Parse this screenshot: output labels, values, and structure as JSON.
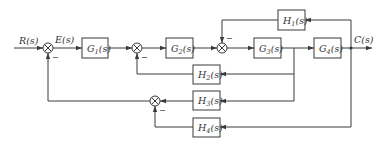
{
  "diagram": {
    "type": "control-system-block-diagram",
    "input_label": "R(s)",
    "error_label": "E(s)",
    "output_label": "C(s)",
    "blocks": [
      {
        "id": "G1",
        "name": "G",
        "sub": "1",
        "tail": "(s)"
      },
      {
        "id": "G2",
        "name": "G",
        "sub": "2",
        "tail": "(s)"
      },
      {
        "id": "G3",
        "name": "G",
        "sub": "3",
        "tail": "(s)"
      },
      {
        "id": "G4",
        "name": "G",
        "sub": "4",
        "tail": "(s)"
      },
      {
        "id": "H1",
        "name": "H",
        "sub": "1",
        "tail": "(s)"
      },
      {
        "id": "H2",
        "name": "H",
        "sub": "2",
        "tail": "(s)"
      },
      {
        "id": "H3",
        "name": "H",
        "sub": "3",
        "tail": "(s)"
      },
      {
        "id": "H4",
        "name": "H",
        "sub": "4",
        "tail": "(s)"
      }
    ],
    "summing_junctions": [
      {
        "id": "S1",
        "inputs": [
          "R(s)",
          "S4 output"
        ],
        "signs": [
          "+",
          "-"
        ]
      },
      {
        "id": "S2",
        "inputs": [
          "G1 output",
          "H2 output"
        ],
        "signs": [
          "+",
          "-"
        ]
      },
      {
        "id": "S3",
        "inputs": [
          "G2 output",
          "H1 output"
        ],
        "signs": [
          "+",
          "-"
        ]
      },
      {
        "id": "S4",
        "inputs": [
          "H3 output",
          "H4 output"
        ],
        "signs": [
          "+",
          "-"
        ]
      }
    ],
    "minus_sign": "−",
    "connections": [
      "R(s) -> S1",
      "S1 -> G1 (E(s))",
      "G1 -> S2",
      "S2 -> G2",
      "G2 -> S3",
      "S3 -> G3",
      "G3 -> G4",
      "G4 -> C(s)",
      "C(s) -> H1 -> S3",
      "G3 output -> H2 -> S2",
      "G3 output -> H3 -> S4",
      "C(s) -> H4 -> S4",
      "S4 -> S1"
    ]
  }
}
